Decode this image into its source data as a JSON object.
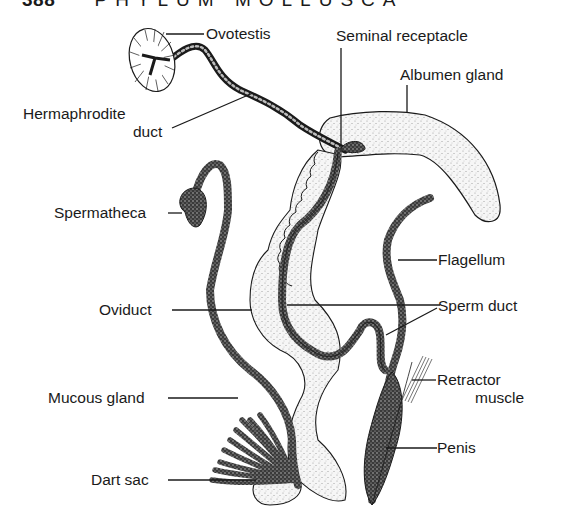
{
  "header": {
    "page_number": "388",
    "running_title": "PHYLUM MOLLUSCA"
  },
  "figure": {
    "labels": {
      "ovotestis": "Ovotestis",
      "seminal_receptacle": "Seminal receptacle",
      "albumen_gland": "Albumen gland",
      "hermaphrodite_duct_line1": "Hermaphrodite",
      "hermaphrodite_duct_line2": "duct",
      "spermatheca": "Spermatheca",
      "flagellum": "Flagellum",
      "oviduct": "Oviduct",
      "sperm_duct": "Sperm duct",
      "retractor_muscle_line1": "Retractor",
      "retractor_muscle_line2": "muscle",
      "mucous_gland": "Mucous gland",
      "penis": "Penis",
      "dart_sac": "Dart sac"
    },
    "colors": {
      "ink": "#1a1a1a",
      "stipple_fill": "#ececec",
      "dark_duct": "#3a3a3a",
      "background": "#ffffff"
    }
  }
}
